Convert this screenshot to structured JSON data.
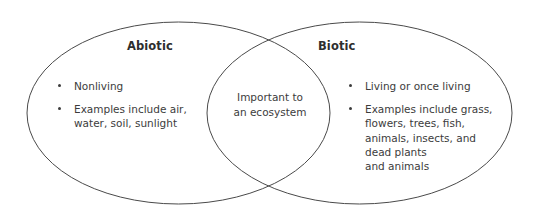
{
  "diagram": {
    "type": "venn-two-set",
    "background_color": "#ffffff",
    "stroke_color": "#4a4a4a",
    "text_color": "#3c3c3c",
    "left_set": {
      "title": "Abiotic",
      "bullets": [
        "Nonliving",
        "Examples include air,\nwater, soil, sunlight"
      ]
    },
    "right_set": {
      "title": "Biotic",
      "bullets": [
        "Living or once living",
        "Examples include grass,\nflowers, trees, fish,\nanimals, insects, and\ndead plants\nand animals"
      ]
    },
    "overlap": {
      "text": "Important to\nan ecosystem"
    }
  }
}
